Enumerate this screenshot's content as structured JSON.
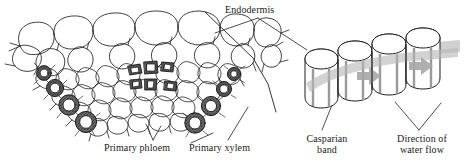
{
  "figure": {
    "background_color": "#ffffff",
    "ink_color": "#1a1a1a",
    "band_color": "#b8b8b8",
    "arrow_color": "#a8a8a8",
    "wall_color": "#4a4a4a"
  },
  "labels": {
    "endodermis": "Endodermis",
    "primary_phloem": "Primary phloem",
    "primary_xylem": "Primary xylem",
    "casparian_band": "Casparian\nband",
    "direction_of_water_flow": "Direction of\nwater flow"
  },
  "panels": {
    "left": {
      "name": "root-cross-section",
      "description": "Sector of a root cross-section showing large outer cortex cells, smaller inner parenchyma, thick-walled primary xylem vessels in two diagonal chains, and a central cluster of primary phloem cells.",
      "cell_groups": [
        {
          "name": "cortex-cells",
          "count": 9,
          "wall": "thin"
        },
        {
          "name": "parenchyma-cells",
          "count": 38,
          "wall": "thin"
        },
        {
          "name": "primary-xylem-vessels-left",
          "count": 5,
          "wall": "thick-stippled"
        },
        {
          "name": "primary-xylem-vessels-right",
          "count": 5,
          "wall": "thick-stippled"
        },
        {
          "name": "primary-phloem-cells",
          "count": 6,
          "wall": "thick-dark"
        }
      ]
    },
    "right": {
      "name": "endodermis-block-diagram",
      "description": "Four three-dimensional endodermal cells in a row, with a continuous gray Casparian band strip running through their radial walls and gray arrows indicating the direction of water flow.",
      "cell_count": 4,
      "arrow_count": 2,
      "band_orientation": "horizontal"
    }
  }
}
